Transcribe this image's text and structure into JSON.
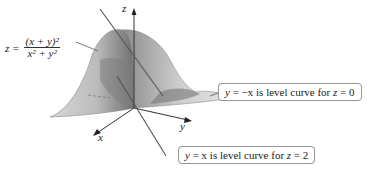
{
  "figure": {
    "surface_formula": {
      "lhs": "z =",
      "numerator": "(x + y)²",
      "denominator": "x² + y²"
    },
    "axes": {
      "x": "x",
      "y": "y",
      "z": "z"
    },
    "callouts": [
      {
        "var": "y",
        "expr": " = −x",
        "text": " is level curve for ",
        "zvar": "z",
        "zval": " = 0"
      },
      {
        "var": "y",
        "expr": " = x",
        "text": " is level curve for ",
        "zvar": "z",
        "zval": " = 2"
      }
    ],
    "colors": {
      "surface_light": "#c9c9c9",
      "surface_dark": "#6e6e6e",
      "line": "#555555"
    }
  }
}
